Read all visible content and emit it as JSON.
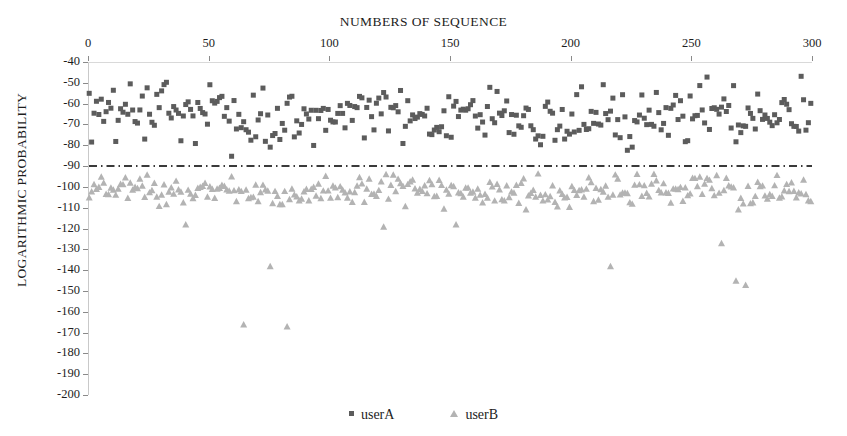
{
  "chart_data": {
    "type": "scatter",
    "title": "NUMBERS OF SEQUENCE",
    "xlabel": "NUMBERS OF SEQUENCE",
    "ylabel": "LOGARITHMIC PROBABILITY",
    "xlim": [
      0,
      300
    ],
    "ylim": [
      -200,
      -40
    ],
    "xticks": [
      0,
      50,
      100,
      150,
      200,
      250,
      300
    ],
    "yticks": [
      -40,
      -50,
      -60,
      -70,
      -80,
      -90,
      -100,
      -110,
      -120,
      -130,
      -140,
      -150,
      -160,
      -170,
      -180,
      -190,
      -200
    ],
    "xtick_labels": [
      "0",
      "50",
      "100",
      "150",
      "200",
      "250",
      "300"
    ],
    "ytick_labels": [
      "-40",
      "-50",
      "-60",
      "-70",
      "-80",
      "-90",
      "-100",
      "-110",
      "-120",
      "-130",
      "-140",
      "-150",
      "-160",
      "-170",
      "-180",
      "-190",
      "-200"
    ],
    "grid": false,
    "axis_top": true,
    "legend_position": "bottom",
    "threshold_line": {
      "label": "threshold",
      "value": -90,
      "style": "dash-dot",
      "color": "#3a3a3a"
    },
    "series": [
      {
        "name": "userA",
        "marker": "square",
        "color": "#5c5c5c",
        "marker_size": 5,
        "n_points": 300,
        "y_mean": -66,
        "y_std": 8.5,
        "y_min": -91,
        "y_max": -46,
        "seed": 20117
      },
      {
        "name": "userB",
        "marker": "triangle",
        "color": "#b3b3b3",
        "marker_size": 7,
        "n_points": 300,
        "y_mean": -101.5,
        "y_std": 4.2,
        "y_min": -112,
        "y_max": -93,
        "seed": 48293,
        "outliers": [
          {
            "x": 64,
            "y": -166
          },
          {
            "x": 75,
            "y": -138
          },
          {
            "x": 82,
            "y": -167
          },
          {
            "x": 122,
            "y": -119
          },
          {
            "x": 216,
            "y": -138
          },
          {
            "x": 262,
            "y": -127
          },
          {
            "x": 268,
            "y": -145
          },
          {
            "x": 272,
            "y": -147
          },
          {
            "x": 152,
            "y": -118
          },
          {
            "x": 40,
            "y": -118
          }
        ]
      }
    ]
  },
  "legend": {
    "items": [
      {
        "label": "userA",
        "marker": "square",
        "color": "#5c5c5c"
      },
      {
        "label": "userB",
        "marker": "triangle",
        "color": "#b3b3b3"
      }
    ]
  },
  "geometry": {
    "plot_left": 88,
    "plot_top": 62,
    "plot_width": 724,
    "plot_height": 333
  }
}
